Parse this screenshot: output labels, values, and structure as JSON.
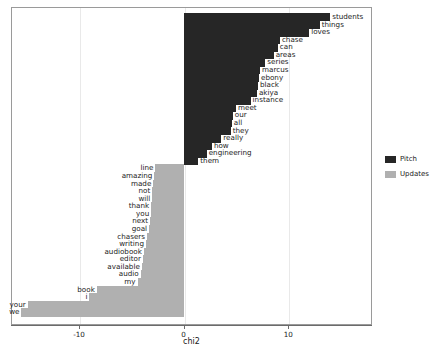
{
  "chart_data": {
    "type": "bar",
    "orientation": "horizontal",
    "title": "",
    "xlabel": "chi2",
    "ylabel": "",
    "xlim": [
      -16.5,
      18.0
    ],
    "xticks": [
      -10,
      0,
      10
    ],
    "xticklabels": [
      "-10",
      "0",
      "10"
    ],
    "grid": true,
    "grid_axis": "x",
    "legend_position": "right",
    "series": [
      {
        "name": "Pitch",
        "color": "#262626",
        "points": [
          {
            "label": "students",
            "value": 14.0
          },
          {
            "label": "things",
            "value": 13.0
          },
          {
            "label": "loves",
            "value": 12.0
          },
          {
            "label": "chase",
            "value": 9.2
          },
          {
            "label": "can",
            "value": 9.0
          },
          {
            "label": "areas",
            "value": 8.6
          },
          {
            "label": "series",
            "value": 7.8
          },
          {
            "label": "marcus",
            "value": 7.3
          },
          {
            "label": "ebony",
            "value": 7.2
          },
          {
            "label": "black",
            "value": 7.1
          },
          {
            "label": "akiya",
            "value": 7.0
          },
          {
            "label": "instance",
            "value": 6.4
          },
          {
            "label": "meet",
            "value": 5.0
          },
          {
            "label": "our",
            "value": 4.7
          },
          {
            "label": "all",
            "value": 4.6
          },
          {
            "label": "they",
            "value": 4.5
          },
          {
            "label": "really",
            "value": 3.6
          },
          {
            "label": "how",
            "value": 2.7
          },
          {
            "label": "engineering",
            "value": 2.2
          },
          {
            "label": "them",
            "value": 1.4
          }
        ]
      },
      {
        "name": "Updates",
        "color": "#b0b0b0",
        "points": [
          {
            "label": "line",
            "value": -2.7
          },
          {
            "label": "amazing",
            "value": -2.8
          },
          {
            "label": "made",
            "value": -2.9
          },
          {
            "label": "not",
            "value": -3.0
          },
          {
            "label": "will",
            "value": -3.0
          },
          {
            "label": "thank",
            "value": -3.1
          },
          {
            "label": "you",
            "value": -3.1
          },
          {
            "label": "next",
            "value": -3.2
          },
          {
            "label": "goal",
            "value": -3.3
          },
          {
            "label": "chasers",
            "value": -3.5
          },
          {
            "label": "writing",
            "value": -3.6
          },
          {
            "label": "audiobook",
            "value": -3.8
          },
          {
            "label": "editor",
            "value": -3.9
          },
          {
            "label": "available",
            "value": -4.0
          },
          {
            "label": "audio",
            "value": -4.1
          },
          {
            "label": "my",
            "value": -4.4
          },
          {
            "label": "book",
            "value": -8.3
          },
          {
            "label": "i",
            "value": -9.0
          },
          {
            "label": "your",
            "value": -14.9
          },
          {
            "label": "we",
            "value": -15.5
          }
        ]
      }
    ]
  },
  "legend": {
    "items": [
      {
        "label": "Pitch",
        "color": "#262626"
      },
      {
        "label": "Updates",
        "color": "#b0b0b0"
      }
    ]
  },
  "axis": {
    "xlabel": "chi2",
    "xticklabels": [
      "-10",
      "0",
      "10"
    ]
  }
}
